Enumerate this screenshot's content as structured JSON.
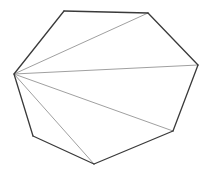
{
  "diagram": {
    "title": "",
    "shape": "heptagon",
    "vertex_labels": [
      "A",
      "B",
      "C",
      "D",
      "E",
      "F",
      "G"
    ],
    "diagonals_from": "A",
    "diagonals": [
      [
        "A",
        "C"
      ],
      [
        "A",
        "D"
      ],
      [
        "A",
        "E"
      ],
      [
        "A",
        "F"
      ]
    ],
    "colors": {
      "edge": "#3a3a3a",
      "diagonal": "#a0a0a0",
      "background": "#ffffff"
    }
  }
}
